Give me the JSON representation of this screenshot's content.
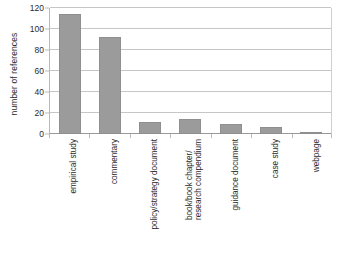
{
  "chart_data": {
    "type": "bar",
    "title": "",
    "xlabel": "",
    "ylabel": "number of references",
    "categories": [
      "empirical study",
      "commentary",
      "policy/strategy document",
      "book/book chapter/ research compendium",
      "guidance document",
      "case study",
      "webpage"
    ],
    "category_lines": [
      [
        "empirical study"
      ],
      [
        "commentary"
      ],
      [
        "policy/strategy document"
      ],
      [
        "book/book chapter/",
        "research compendium"
      ],
      [
        "guidance document"
      ],
      [
        "case study"
      ],
      [
        "webpage"
      ]
    ],
    "values": [
      114,
      92,
      11,
      14,
      10,
      7,
      2
    ],
    "ylim": [
      0,
      120
    ],
    "yticks": [
      0,
      20,
      40,
      60,
      80,
      100,
      120
    ],
    "ytick_labels": [
      "0",
      "20",
      "40",
      "60",
      "80",
      "100",
      "120"
    ],
    "grid": true,
    "legend": false,
    "bar_color": "#9b9b9b",
    "bar_border_color": "#8f8f8f",
    "gridline_color": "#c6c6c6",
    "axis_color": "#b9b9b9",
    "background": "#ffffff",
    "text_color": "#2b2b2b"
  }
}
